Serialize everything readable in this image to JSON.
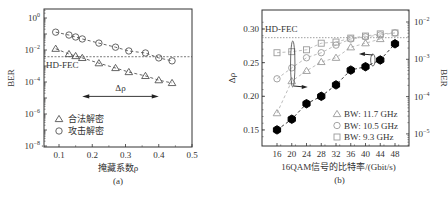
{
  "chart_data": [
    {
      "panel": "(a)",
      "type": "scatter",
      "title": "",
      "xlabel": "掩藏系数ρ",
      "ylabel": "BER",
      "xlim": [
        0.05,
        0.5
      ],
      "ylim_log10": [
        -8,
        0.6
      ],
      "yscale": "log",
      "x_ticks": [
        "0.1",
        "0.2",
        "0.3",
        "0.4",
        "0.5"
      ],
      "x_tick_values": [
        0.1,
        0.2,
        0.3,
        0.4,
        0.5
      ],
      "y_ticks": [
        "10^0",
        "10^-2",
        "10^-4",
        "10^-6",
        "10^-8"
      ],
      "y_tick_exponents": [
        0,
        -2,
        -4,
        -6,
        -8
      ],
      "grid": false,
      "legend_position": "lower-left",
      "threshold": {
        "label": "HD-FEC",
        "value": 0.0038
      },
      "annotation": {
        "label": "Δρ",
        "from_x": 0.17,
        "to_x": 0.4,
        "y_exponent": -4.9
      },
      "series": [
        {
          "name": "合法解密",
          "marker": "triangle",
          "x": [
            0.09,
            0.13,
            0.15,
            0.17,
            0.22,
            0.27,
            0.31,
            0.36,
            0.4,
            0.44
          ],
          "values": [
            0.012,
            0.0056,
            0.0042,
            0.0032,
            0.0015,
            0.00075,
            0.00042,
            0.00024,
            0.00013,
            8.7e-05
          ]
        },
        {
          "name": "攻击解密",
          "marker": "circle",
          "x": [
            0.09,
            0.13,
            0.15,
            0.17,
            0.22,
            0.27,
            0.31,
            0.36,
            0.4,
            0.44
          ],
          "values": [
            0.13,
            0.086,
            0.065,
            0.049,
            0.027,
            0.015,
            0.0087,
            0.0065,
            0.0032,
            0.0021
          ]
        }
      ]
    },
    {
      "panel": "(b)",
      "type": "scatter",
      "title": "",
      "xlabel": "16QAM信号的比特率/(Gbit/s)",
      "ylabel": "Δρ",
      "ylabel_right": "BER",
      "categories": [
        16,
        20,
        24,
        28,
        32,
        36,
        40,
        44,
        48
      ],
      "x_ticks": [
        "16",
        "20",
        "24",
        "28",
        "32",
        "36",
        "40",
        "44",
        "48"
      ],
      "xlim": [
        12,
        52
      ],
      "ylim": [
        0.13,
        0.33
      ],
      "y_ticks": [
        "0.15",
        "0.20",
        "0.25",
        "0.30"
      ],
      "y_tick_values": [
        0.15,
        0.2,
        0.25,
        0.3
      ],
      "y_right_scale": "log",
      "y_right_ticks": [
        "10^-5",
        "10^-4",
        "10^-3",
        "10^-2"
      ],
      "y_right_tick_exponents": [
        -5,
        -4,
        -3,
        -2
      ],
      "grid": false,
      "legend_position": "lower-right",
      "threshold": {
        "label": "HD-FEC",
        "value": 0.0038,
        "axis": "right"
      },
      "series": [
        {
          "name": "Δρ",
          "axis": "left",
          "marker": "filled-hexagon",
          "values": [
            0.15,
            0.166,
            0.189,
            0.2,
            0.217,
            0.239,
            0.244,
            0.254,
            0.278
          ]
        },
        {
          "name": "BW: 11.7 GHz",
          "axis": "right",
          "marker": "triangle",
          "values": [
            3.6e-05,
            0.00026,
            0.00049,
            0.00085,
            0.0011,
            0.0021,
            0.0027,
            0.0035,
            null
          ]
        },
        {
          "name": "BW: 10.5 GHz",
          "axis": "right",
          "marker": "circle",
          "values": [
            0.0003,
            0.00059,
            0.0011,
            0.0015,
            0.0024,
            0.0035,
            0.004,
            0.0045,
            0.0051
          ]
        },
        {
          "name": "BW: 9.3 GHz",
          "axis": "right",
          "marker": "square",
          "values": [
            0.0015,
            0.0016,
            0.0018,
            0.0027,
            0.0029,
            0.0037,
            0.0042,
            0.0048,
            0.0051
          ]
        }
      ]
    }
  ],
  "panels": {
    "a": {
      "caption": "(a)",
      "xlabel": "掩藏系数ρ",
      "ylabel": "BER",
      "fec_label": "HD-FEC",
      "delta_label": "Δρ",
      "legend": [
        "合法解密",
        "攻击解密"
      ]
    },
    "b": {
      "caption": "(b)",
      "xlabel": "16QAM信号的比特率/(Gbit/s)",
      "ylabel_left": "Δρ",
      "ylabel_right": "BER",
      "fec_label": "HD-FEC",
      "legend": [
        "BW: 11.7 GHz",
        "BW: 10.5 GHz",
        "BW: 9.3 GHz"
      ]
    }
  },
  "colors": {
    "axis": "#333333",
    "marker_gray": "#9a9a9a",
    "marker_dark": "#555555",
    "filled": "#000000"
  }
}
